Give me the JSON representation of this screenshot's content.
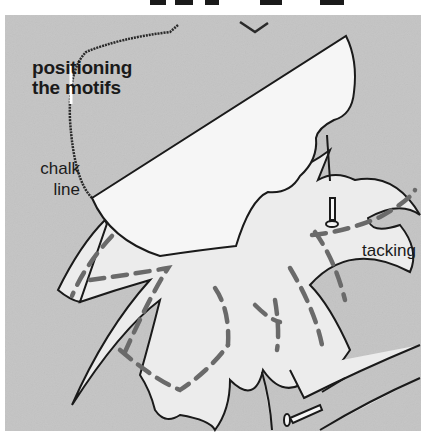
{
  "illustration": {
    "title_lines": [
      "positioning",
      "the motifs"
    ],
    "labels": {
      "chalk_line": [
        "chalk",
        "line"
      ],
      "tacking": "tacking"
    },
    "colors": {
      "background": "#c4c4c4",
      "page": "#ffffff",
      "template": "#f4f4f4",
      "fabric_motif": "#ececec",
      "outline": "#1a1a1a",
      "tacking_stitches": "#6a6a6a",
      "chalk_line": "#2a2a2a"
    },
    "elements": [
      "paper template",
      "flower motif",
      "pins",
      "chalk line",
      "tacking stitches",
      "stem"
    ]
  }
}
